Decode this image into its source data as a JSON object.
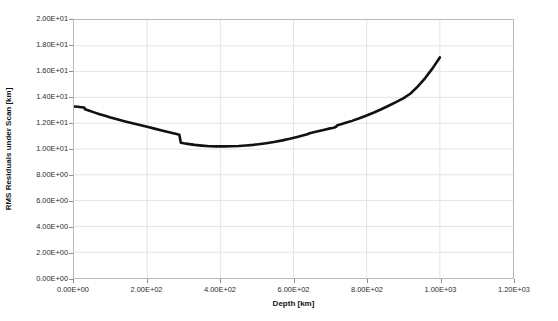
{
  "chart_data": {
    "type": "line",
    "title": "",
    "xlabel": "Depth [km]",
    "ylabel": "RMS Residuals under Scan [km]",
    "xlim": [
      0,
      1200
    ],
    "ylim": [
      0,
      20
    ],
    "xticks": [
      0,
      200,
      400,
      600,
      800,
      1000,
      1200
    ],
    "yticks": [
      0,
      2,
      4,
      6,
      8,
      10,
      12,
      14,
      16,
      18,
      20
    ],
    "xtick_labels": [
      "0.00E+00",
      "2.00E+02",
      "4.00E+02",
      "6.00E+02",
      "8.00E+02",
      "1.00E+03",
      "1.20E+03"
    ],
    "ytick_labels": [
      "0.00E+00",
      "2.00E+00",
      "4.00E+00",
      "6.00E+00",
      "8.00E+00",
      "1.00E+01",
      "1.20E+01",
      "1.40E+01",
      "1.60E+01",
      "1.80E+01",
      "2.00E+01"
    ],
    "grid": true,
    "grid_color": "#e4e4e4",
    "legend": false,
    "legend_position": "none",
    "series": [
      {
        "name": "RMS Residuals under Scan",
        "color": "#111111",
        "line_width": 2.6,
        "x": [
          0,
          10,
          20,
          28,
          30,
          40,
          55,
          70,
          85,
          100,
          120,
          140,
          160,
          180,
          200,
          220,
          240,
          260,
          280,
          288,
          292,
          300,
          315,
          330,
          350,
          370,
          390,
          410,
          430,
          450,
          470,
          490,
          510,
          530,
          550,
          570,
          590,
          610,
          625,
          638,
          642,
          655,
          670,
          685,
          700,
          706,
          712,
          716,
          720,
          730,
          745,
          760,
          780,
          800,
          820,
          840,
          860,
          880,
          900,
          920,
          940,
          960,
          980,
          1000
        ],
        "y": [
          13.3,
          13.27,
          13.24,
          13.22,
          13.08,
          12.98,
          12.84,
          12.7,
          12.57,
          12.45,
          12.29,
          12.14,
          12.0,
          11.86,
          11.72,
          11.58,
          11.44,
          11.3,
          11.16,
          11.1,
          10.48,
          10.44,
          10.38,
          10.32,
          10.26,
          10.21,
          10.2,
          10.2,
          10.21,
          10.23,
          10.27,
          10.32,
          10.39,
          10.47,
          10.56,
          10.67,
          10.79,
          10.93,
          11.04,
          11.14,
          11.2,
          11.29,
          11.39,
          11.5,
          11.6,
          11.63,
          11.67,
          11.72,
          11.84,
          11.92,
          12.05,
          12.18,
          12.38,
          12.6,
          12.83,
          13.08,
          13.35,
          13.63,
          13.93,
          14.3,
          14.85,
          15.5,
          16.25,
          17.1
        ]
      }
    ]
  },
  "axes": {
    "y_title": "RMS Residuals under Scan [km]",
    "x_title": "Depth [km]"
  }
}
